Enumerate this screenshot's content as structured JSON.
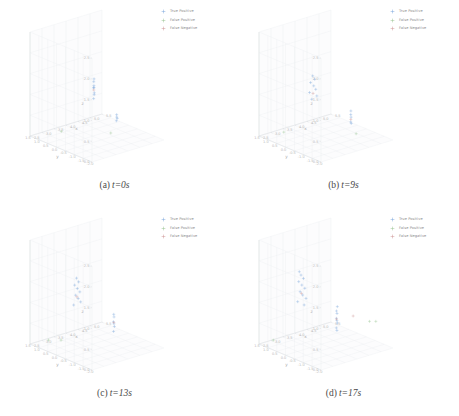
{
  "figure": {
    "title": "",
    "layout": "2x2 grid of 3D scatter subplots"
  },
  "legend": {
    "entries": [
      {
        "label": "True Positive",
        "color": "#6f9fd8",
        "marker": "plus"
      },
      {
        "label": "False Positive",
        "color": "#8fbf86",
        "marker": "plus"
      },
      {
        "label": "False Negative",
        "color": "#c98a8a",
        "marker": "plus"
      }
    ]
  },
  "axes": {
    "x": {
      "label": "x",
      "ticks": [
        "2.5",
        "3.0",
        "3.5",
        "4.0",
        "4.5",
        "5.0",
        "5.5"
      ],
      "range": [
        2.5,
        5.5
      ]
    },
    "y": {
      "label": "y",
      "ticks": [
        "1.5",
        "1.0",
        "0.5",
        "0.0",
        "-0.5",
        "-1.0",
        "-1.5",
        "-2.0"
      ],
      "range": [
        1.5,
        -2.0
      ]
    },
    "z": {
      "label": "z",
      "ticks": [
        "0.0",
        "0.5",
        "1.0",
        "1.5",
        "2.0",
        "2.5"
      ],
      "range": [
        0.0,
        2.5
      ]
    }
  },
  "panels": [
    {
      "id": "a",
      "tag": "(a)",
      "time_label": "t=0s",
      "chart_data": {
        "type": "scatter",
        "title": "t=0s",
        "xlabel": "x",
        "ylabel": "y",
        "zlabel": "z",
        "xlim": [
          2.5,
          5.5
        ],
        "ylim": [
          -2.0,
          1.5
        ],
        "zlim": [
          0.0,
          2.5
        ],
        "grid": true,
        "legend_position": "top-right",
        "series": [
          {
            "name": "True Positive",
            "color": "#6f9fd8",
            "points": [
              [
                4.05,
                0.0,
                1.3
              ],
              [
                4.02,
                -0.05,
                1.22
              ],
              [
                4.1,
                0.05,
                1.14
              ],
              [
                4.0,
                -0.1,
                1.06
              ],
              [
                4.08,
                0.02,
                0.98
              ],
              [
                4.03,
                -0.02,
                0.9
              ],
              [
                4.12,
                0.08,
                1.34
              ],
              [
                3.98,
                -0.08,
                1.18
              ],
              [
                4.6,
                -0.55,
                0.45
              ],
              [
                4.66,
                -0.5,
                0.4
              ],
              [
                4.55,
                -0.6,
                0.38
              ],
              [
                4.62,
                -0.52,
                0.5
              ]
            ]
          },
          {
            "name": "False Positive",
            "color": "#8fbf86",
            "points": [
              [
                3.4,
                0.95,
                0.05
              ],
              [
                4.5,
                -0.35,
                0.05
              ]
            ]
          },
          {
            "name": "False Negative",
            "color": "#c98a8a",
            "points": [
              [
                4.05,
                0.0,
                1.1
              ]
            ]
          }
        ]
      }
    },
    {
      "id": "b",
      "tag": "(b)",
      "time_label": "t=9s",
      "chart_data": {
        "type": "scatter",
        "title": "t=9s",
        "xlabel": "x",
        "ylabel": "y",
        "zlabel": "z",
        "xlim": [
          2.5,
          5.5
        ],
        "ylim": [
          -2.0,
          1.5
        ],
        "zlim": [
          0.0,
          2.5
        ],
        "grid": true,
        "legend_position": "top-right",
        "series": [
          {
            "name": "True Positive",
            "color": "#6f9fd8",
            "points": [
              [
                3.85,
                0.3,
                1.42
              ],
              [
                3.9,
                0.25,
                1.34
              ],
              [
                3.8,
                0.35,
                1.26
              ],
              [
                3.88,
                0.28,
                1.18
              ],
              [
                3.92,
                0.22,
                1.1
              ],
              [
                3.78,
                0.38,
                1.02
              ],
              [
                3.95,
                0.2,
                0.94
              ],
              [
                3.83,
                0.32,
                0.86
              ],
              [
                4.7,
                -0.7,
                0.52
              ],
              [
                4.75,
                -0.65,
                0.44
              ],
              [
                4.66,
                -0.75,
                0.36
              ],
              [
                4.72,
                -0.68,
                0.6
              ],
              [
                4.78,
                -0.62,
                0.28
              ]
            ]
          },
          {
            "name": "False Positive",
            "color": "#8fbf86",
            "points": [
              [
                3.2,
                1.05,
                0.05
              ],
              [
                4.85,
                -0.8,
                0.05
              ]
            ]
          },
          {
            "name": "False Negative",
            "color": "#c98a8a",
            "points": [
              [
                3.86,
                0.29,
                1.0
              ],
              [
                4.71,
                -0.69,
                0.4
              ]
            ]
          }
        ]
      }
    },
    {
      "id": "c",
      "tag": "(c)",
      "time_label": "t=13s",
      "chart_data": {
        "type": "scatter",
        "title": "t=13s",
        "xlabel": "x",
        "ylabel": "y",
        "zlabel": "z",
        "xlim": [
          2.5,
          5.5
        ],
        "ylim": [
          -2.0,
          1.5
        ],
        "zlim": [
          0.0,
          2.5
        ],
        "grid": true,
        "legend_position": "top-right",
        "series": [
          {
            "name": "True Positive",
            "color": "#6f9fd8",
            "points": [
              [
                3.7,
                0.5,
                1.55
              ],
              [
                3.75,
                0.45,
                1.46
              ],
              [
                3.66,
                0.55,
                1.38
              ],
              [
                3.72,
                0.48,
                1.3
              ],
              [
                3.78,
                0.42,
                1.22
              ],
              [
                3.68,
                0.52,
                1.14
              ],
              [
                3.74,
                0.46,
                1.06
              ],
              [
                3.8,
                0.4,
                0.98
              ],
              [
                3.64,
                0.58,
                0.9
              ],
              [
                4.55,
                -0.45,
                0.7
              ],
              [
                4.6,
                -0.4,
                0.62
              ],
              [
                4.5,
                -0.5,
                0.54
              ],
              [
                4.58,
                -0.42,
                0.46
              ],
              [
                4.63,
                -0.38,
                0.38
              ],
              [
                4.52,
                -0.48,
                0.3
              ]
            ]
          },
          {
            "name": "False Positive",
            "color": "#8fbf86",
            "points": [
              [
                3.05,
                1.2,
                0.05
              ],
              [
                3.35,
                0.9,
                0.05
              ]
            ]
          },
          {
            "name": "False Negative",
            "color": "#c98a8a",
            "points": [
              [
                3.71,
                0.49,
                1.1
              ],
              [
                4.56,
                -0.44,
                0.5
              ]
            ]
          }
        ]
      }
    },
    {
      "id": "d",
      "tag": "(d)",
      "time_label": "t=17s",
      "chart_data": {
        "type": "scatter",
        "title": "t=17s",
        "xlabel": "x",
        "ylabel": "y",
        "zlabel": "z",
        "xlim": [
          2.5,
          5.5
        ],
        "ylim": [
          -2.0,
          1.5
        ],
        "zlim": [
          0.0,
          2.5
        ],
        "grid": true,
        "legend_position": "top-right",
        "series": [
          {
            "name": "True Positive",
            "color": "#6f9fd8",
            "points": [
              [
                3.6,
                0.62,
                1.62
              ],
              [
                3.66,
                0.56,
                1.54
              ],
              [
                3.55,
                0.68,
                1.46
              ],
              [
                3.62,
                0.6,
                1.38
              ],
              [
                3.7,
                0.54,
                1.3
              ],
              [
                3.58,
                0.64,
                1.22
              ],
              [
                3.64,
                0.58,
                1.14
              ],
              [
                3.72,
                0.5,
                1.06
              ],
              [
                3.52,
                0.7,
                0.98
              ],
              [
                3.68,
                0.55,
                0.9
              ],
              [
                3.56,
                0.66,
                1.7
              ],
              [
                4.4,
                -0.3,
                0.78
              ],
              [
                4.46,
                -0.25,
                0.7
              ],
              [
                4.36,
                -0.35,
                0.62
              ],
              [
                4.43,
                -0.28,
                0.54
              ],
              [
                4.5,
                -0.22,
                0.46
              ],
              [
                4.38,
                -0.32,
                0.38
              ],
              [
                4.44,
                -0.27,
                0.3
              ],
              [
                4.48,
                -0.24,
                0.86
              ]
            ]
          },
          {
            "name": "False Positive",
            "color": "#8fbf86",
            "points": [
              [
                2.95,
                1.3,
                0.05
              ],
              [
                5.15,
                -1.15,
                0.55
              ],
              [
                5.3,
                -1.3,
                0.55
              ]
            ]
          },
          {
            "name": "False Negative",
            "color": "#c98a8a",
            "points": [
              [
                3.61,
                0.61,
                1.18
              ],
              [
                4.41,
                -0.29,
                0.58
              ],
              [
                4.8,
                -0.7,
                0.66
              ]
            ]
          }
        ]
      }
    }
  ]
}
